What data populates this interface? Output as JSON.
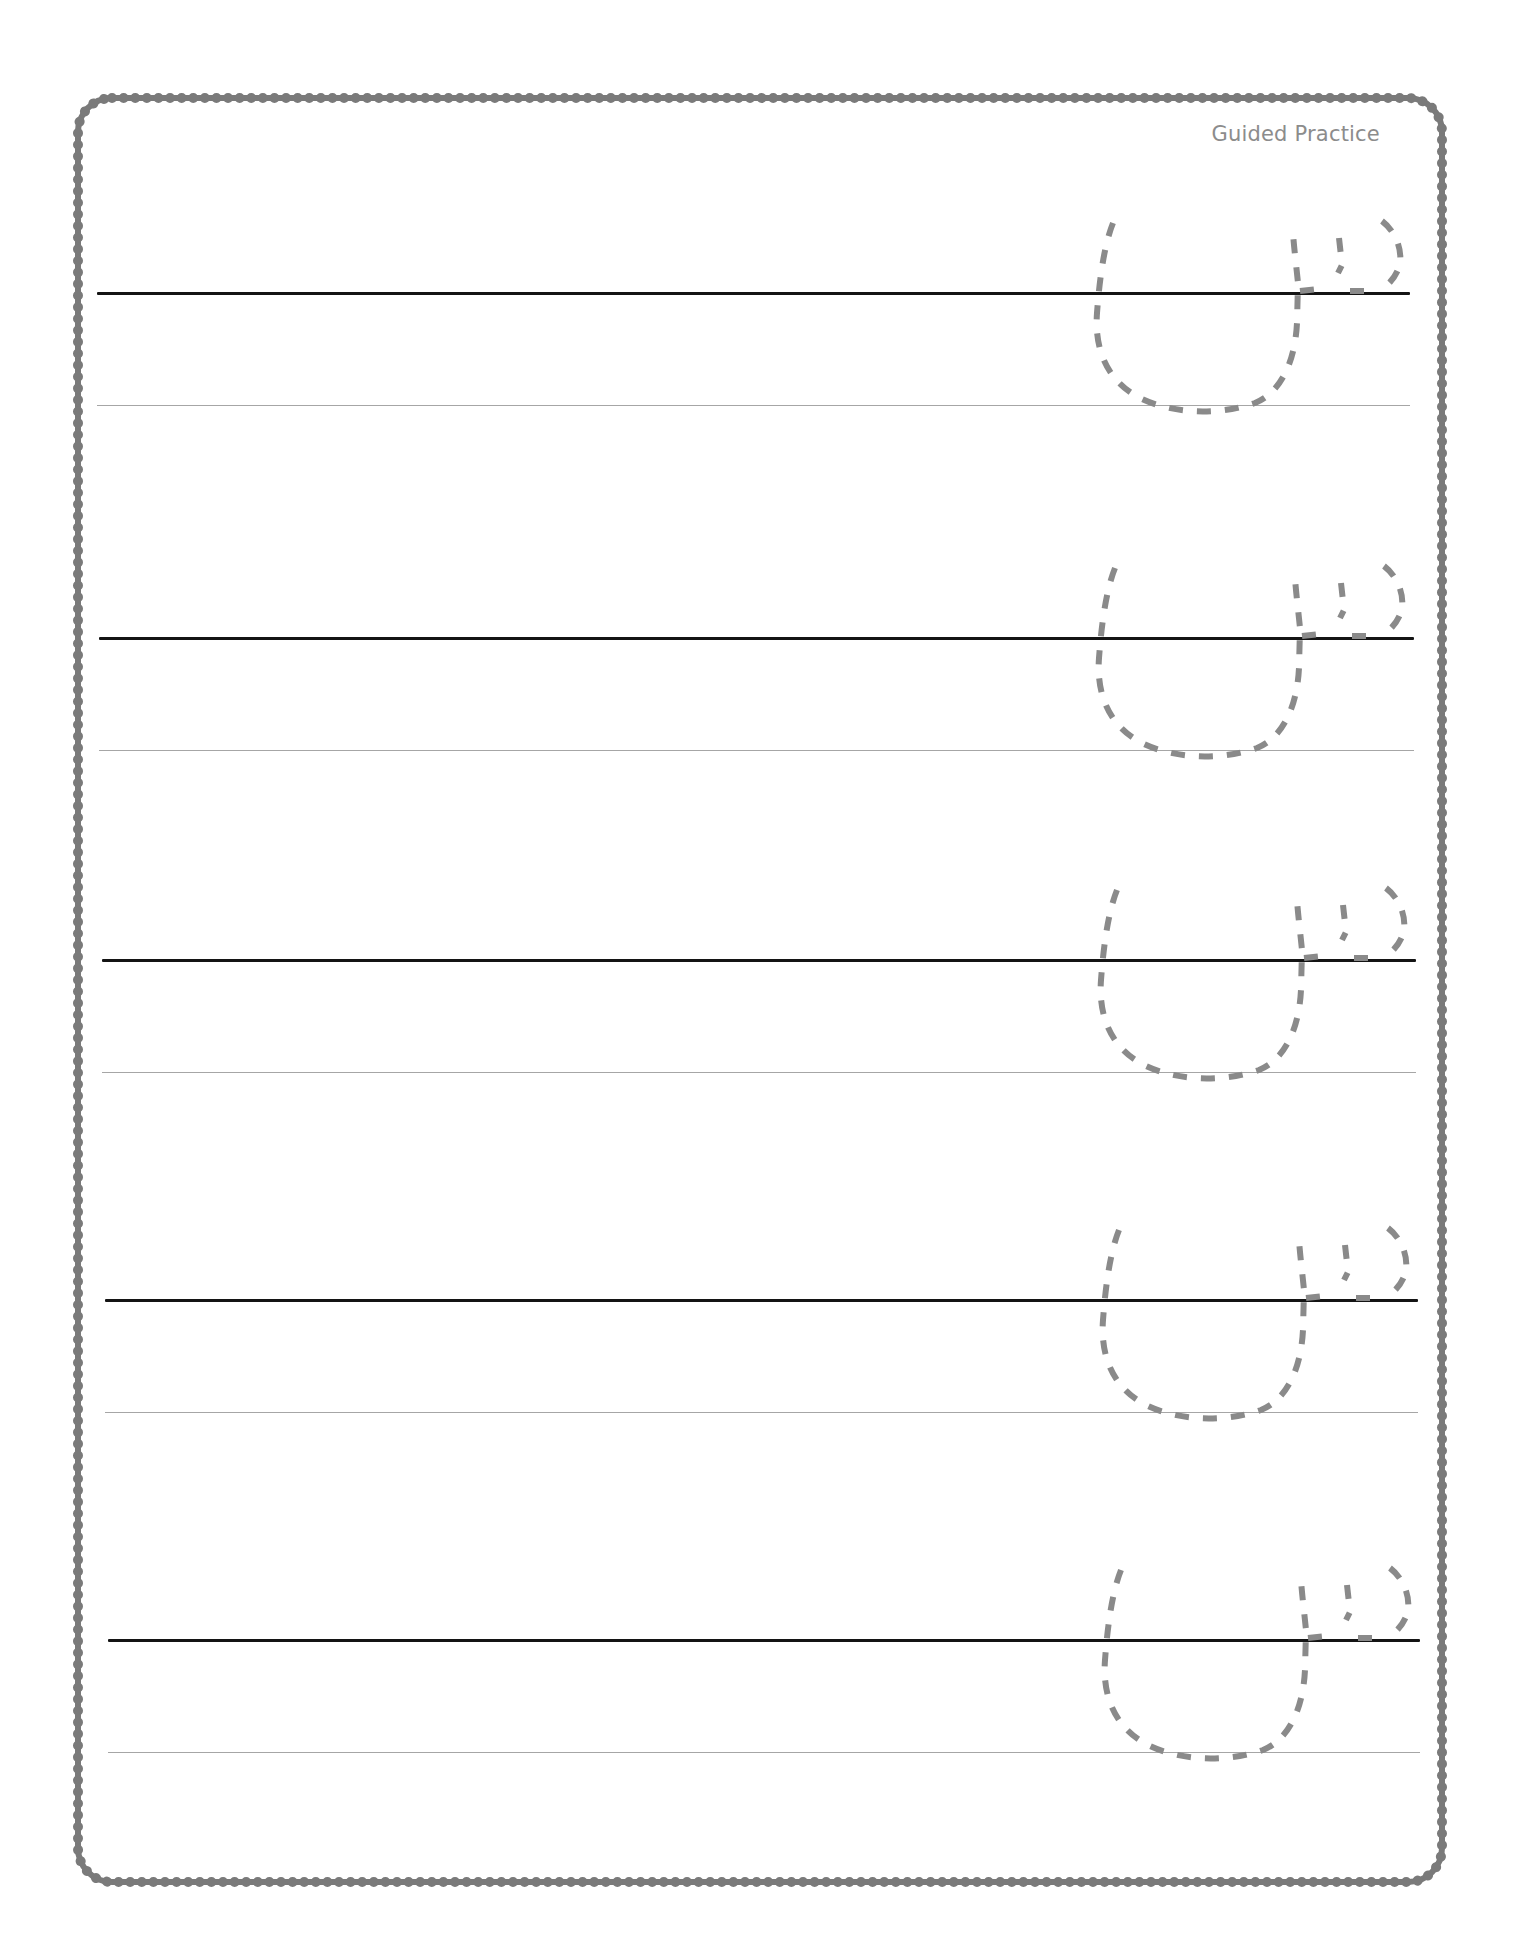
{
  "page": {
    "header_label": "Guided Practice",
    "colors": {
      "border": "#7a7a7a",
      "baseline": "#141414",
      "guideline": "#a6a6a6",
      "trace": "#8a8a8a",
      "label": "#8c8c8c",
      "background": "#ffffff"
    }
  },
  "rows": [
    {
      "index": 1,
      "baseline_y": 293,
      "guideline_y": 405,
      "line_start_x": 97,
      "line_end_x": 1410,
      "trace_letter": "ص"
    },
    {
      "index": 2,
      "baseline_y": 638,
      "guideline_y": 750,
      "line_start_x": 99,
      "line_end_x": 1414,
      "trace_letter": "ص"
    },
    {
      "index": 3,
      "baseline_y": 960,
      "guideline_y": 1072,
      "line_start_x": 102,
      "line_end_x": 1416,
      "trace_letter": "ص"
    },
    {
      "index": 4,
      "baseline_y": 1300,
      "guideline_y": 1412,
      "line_start_x": 105,
      "line_end_x": 1418,
      "trace_letter": "ص"
    },
    {
      "index": 5,
      "baseline_y": 1640,
      "guideline_y": 1752,
      "line_start_x": 108,
      "line_end_x": 1420,
      "trace_letter": "ص"
    }
  ]
}
